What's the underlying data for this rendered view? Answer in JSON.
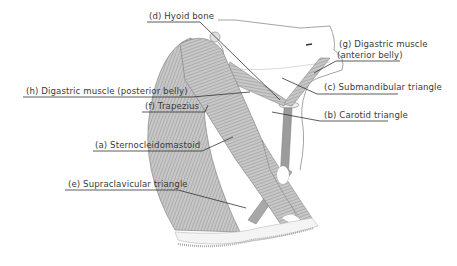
{
  "diagram": {
    "labels": {
      "a": "(a) Sternocleidomastoid",
      "b": "(b) Carotid triangle",
      "c": "(c) Submandibular triangle",
      "d": "(d) Hyoid bone",
      "e": "(e) Supraclavicular triangle",
      "f": "(f) Trapezius",
      "g_line1": "(g) Digastric muscle",
      "g_line2": "(anterior belly)",
      "h": "(h) Digastric muscle (posterior belly)"
    },
    "colors": {
      "muscle_fill": "#bdbdbd",
      "muscle_stroke": "#7a7a7a",
      "leader_line": "#333333",
      "text": "#3a3a3a"
    }
  }
}
